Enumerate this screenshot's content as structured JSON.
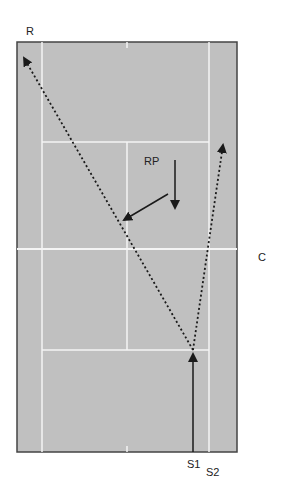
{
  "diagram": {
    "type": "tennis-court-drill",
    "colors": {
      "court": "#c0c0c0",
      "lines": "#f4f4f4",
      "border": "#444444",
      "arrows": "#1a1a1a"
    },
    "labels": {
      "receiver": "R",
      "receiver_partner": "RP",
      "center": "C",
      "server1": "S1",
      "server2": "S2"
    },
    "arrows": [
      {
        "id": "serve",
        "style": "solid",
        "from": "S1 baseline",
        "to": "service line center"
      },
      {
        "id": "cross-court-return",
        "style": "dotted",
        "from": "service line center",
        "to": "R corner"
      },
      {
        "id": "wide-shot",
        "style": "dotted",
        "from": "service line center",
        "to": "right singles sideline"
      },
      {
        "id": "rp-forward",
        "style": "solid",
        "from": "RP",
        "to": "down"
      },
      {
        "id": "rp-diagonal",
        "style": "solid",
        "from": "RP",
        "to": "lower-left"
      }
    ]
  }
}
